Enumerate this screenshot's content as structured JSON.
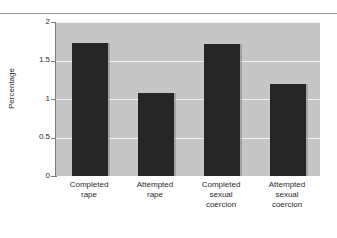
{
  "chart_data": {
    "type": "bar",
    "title": "",
    "subtitle": "",
    "xlabel": "",
    "ylabel": "Percentage",
    "ylim": [
      0,
      2
    ],
    "yticks": [
      "0",
      "0.5",
      "1",
      "1.5",
      "2"
    ],
    "ytick_values": [
      0,
      0.5,
      1,
      1.5,
      2
    ],
    "grid": true,
    "legend": "none",
    "categories": [
      "Completed rape",
      "Attempted rape",
      "Completed sexual coercion",
      "Attempted sexual coercion"
    ],
    "category_lines": [
      [
        "Completed",
        "rape"
      ],
      [
        "Attempted",
        "rape"
      ],
      [
        "Completed",
        "sexual",
        "coercion"
      ],
      [
        "Attempted",
        "sexual",
        "coercion"
      ]
    ],
    "values": [
      1.73,
      1.08,
      1.72,
      1.2
    ],
    "bar_color": "#262626",
    "plot_background": "#c6c6c6",
    "gridline_color": "#f2f2f2",
    "axis_color": "#7d7d7d"
  }
}
